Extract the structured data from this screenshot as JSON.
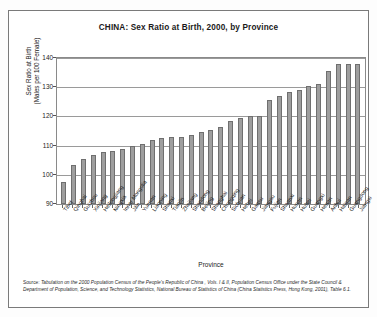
{
  "figure": {
    "title": "CHINA: Sex Ratio at Birth, 2000, by Province",
    "xaxis_title": "Province",
    "yaxis_title_line1": "Sex Ratio at Birth",
    "yaxis_title_line2": "(Males per 100 Female)",
    "source_label": "Source:",
    "source_text": " Tabulation on the 2000 Population Census of the People's Republic of China , Vols. I & II, Population Census Office under the State Council & Department of Population, Science, and Technology Statistics, National Bureau of Statistics of China (China Statistics Press, Hong Kong, 2001), Table 6.1."
  },
  "chart_data": {
    "type": "bar",
    "title": "CHINA: Sex Ratio at Birth, 2000, by Province",
    "xlabel": "Province",
    "ylabel": "Sex Ratio at Birth (Males per 100 Female)",
    "ylim": [
      90,
      140
    ],
    "yticks": [
      90,
      100,
      110,
      120,
      130,
      140
    ],
    "grid": true,
    "legend": "none",
    "categories": [
      "Tibet",
      "Qinghai",
      "Guizhou",
      "Xinjiang",
      "Heilongjiang",
      "Ningxia",
      "Inner Mongolia",
      "Jilin",
      "Yunnan",
      "Liaoning",
      "Shanxi",
      "Tianjin",
      "Zhejiang",
      "Shandong",
      "Beijing",
      "Shanghai",
      "Chongqing",
      "Sichuan",
      "Hebei",
      "Gansu",
      "Jiangsu",
      "Fujian",
      "Shaanxi",
      "Hunan",
      "Hubei",
      "Guangxi",
      "Henan",
      "Anhui",
      "Hainan",
      "Guangdong",
      "Jiangxi"
    ],
    "values": [
      97.4,
      103.5,
      105.3,
      106.7,
      107.7,
      108.2,
      108.8,
      110.0,
      110.6,
      112.0,
      112.6,
      112.8,
      113.0,
      113.5,
      114.5,
      115.3,
      116.4,
      118.4,
      119.5,
      120.2,
      120.3,
      125.5,
      127.0,
      128.3,
      129.0,
      130.3,
      131.0,
      135.5,
      138.0,
      138.1,
      138.1
    ],
    "bar_color": "#9e9e9e",
    "bar_edge_color": "#6f6f6f"
  }
}
